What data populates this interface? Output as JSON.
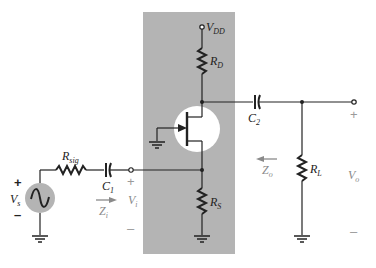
{
  "diagram": {
    "type": "JFET common-source self-bias amplifier (bypassed source resistor absent)",
    "colors": {
      "panel": "#b4b4b4",
      "wire": "#222222",
      "source_fill": "#b4b4b4",
      "jfet_bg": "#ffffff",
      "annotation_gray": "#8a8a8a"
    },
    "labels": {
      "vdd": "V",
      "vdd_sub": "DD",
      "rd": "R",
      "rd_sub": "D",
      "rs": "R",
      "rs_sub": "S",
      "rsig": "R",
      "rsig_sub": "sig",
      "c1": "C",
      "c1_sub": "1",
      "c2": "C",
      "c2_sub": "2",
      "rl": "R",
      "rl_sub": "L",
      "vs": "V",
      "vs_sub": "s",
      "vi": "V",
      "vi_sub": "i",
      "vo": "V",
      "vo_sub": "o",
      "zi": "Z",
      "zi_sub": "i",
      "zo": "Z",
      "zo_sub": "o"
    },
    "signs": {
      "vs_plus": "+",
      "vs_minus": "–",
      "vi_plus": "+",
      "vi_minus": "–",
      "vo_plus": "+",
      "vo_minus": "–"
    }
  }
}
